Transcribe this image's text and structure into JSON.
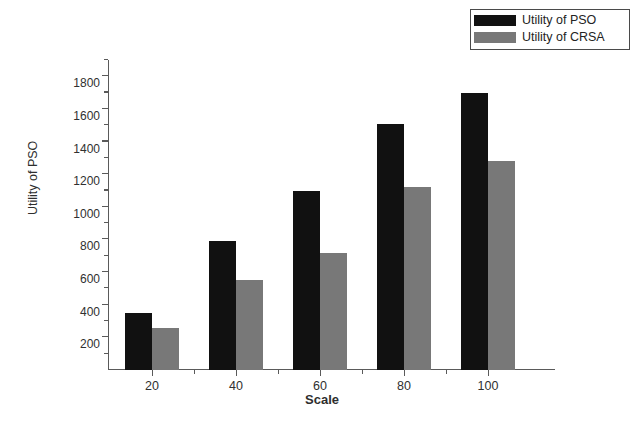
{
  "chart_data": {
    "type": "bar",
    "title": "",
    "xlabel": "Scale",
    "ylabel": "Utility of PSO",
    "categories": [
      "20",
      "40",
      "60",
      "80",
      "100"
    ],
    "series": [
      {
        "name": "Utility of PSO",
        "color": "#111111",
        "values": [
          350,
          790,
          1100,
          1510,
          1700
        ]
      },
      {
        "name": "Utility of CRSA",
        "color": "#787878",
        "values": [
          255,
          550,
          720,
          1120,
          1280
        ]
      }
    ],
    "ylim": [
      0,
      1900
    ],
    "ytick_values": [
      200,
      400,
      600,
      800,
      1000,
      1200,
      1400,
      1600,
      1800
    ],
    "ytick_labels": [
      "200",
      "400",
      "600",
      "800",
      "1000",
      "1200",
      "1400",
      "1600",
      "1800"
    ],
    "yminor_values": [
      100,
      300,
      500,
      700,
      900,
      1100,
      1300,
      1500,
      1700,
      1900
    ],
    "xtick_labels": [
      "20",
      "40",
      "60",
      "80",
      "100"
    ],
    "grid": false,
    "legend_position": "top-right"
  },
  "legend": {
    "items": [
      {
        "label": "Utility of PSO",
        "color": "#111111"
      },
      {
        "label": "Utility of CRSA",
        "color": "#787878"
      }
    ]
  },
  "axes": {
    "x_title": "Scale",
    "y_title": "Utility of PSO"
  }
}
